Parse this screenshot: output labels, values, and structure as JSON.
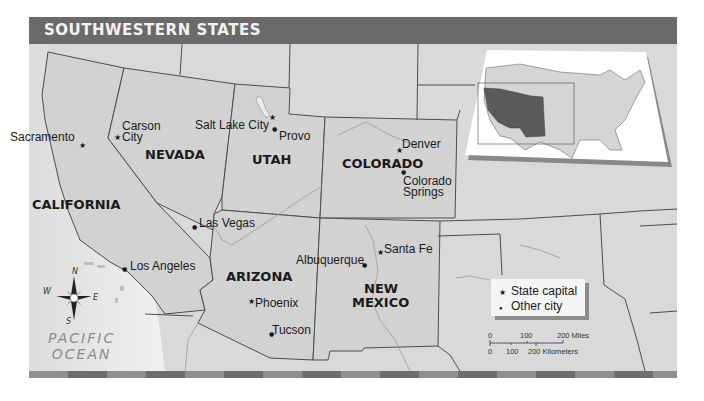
{
  "title": "SOUTHWESTERN STATES",
  "states": [
    {
      "name": "CALIFORNIA",
      "x": 32,
      "y": 198
    },
    {
      "name": "NEVADA",
      "x": 145,
      "y": 148
    },
    {
      "name": "UTAH",
      "x": 252,
      "y": 153
    },
    {
      "name": "COLORADO",
      "x": 342,
      "y": 157
    },
    {
      "name": "ARIZONA",
      "x": 226,
      "y": 270
    },
    {
      "name": "NEW",
      "x": 364,
      "y": 282
    },
    {
      "name": "MEXICO",
      "x": 352,
      "y": 296
    }
  ],
  "cities": [
    {
      "name": "Sacramento",
      "type": "capital",
      "x": 82,
      "y": 146,
      "label_x": 10,
      "label_y": 131
    },
    {
      "name": "Carson",
      "type": "capital",
      "x": 117,
      "y": 138,
      "label_x": 122,
      "label_y": 120
    },
    {
      "name": "City",
      "type": "none",
      "x": 0,
      "y": 0,
      "label_x": 122,
      "label_y": 131
    },
    {
      "name": "Salt Lake City",
      "type": "capital",
      "x": 272,
      "y": 118,
      "label_x": 195,
      "label_y": 119
    },
    {
      "name": "Provo",
      "type": "city",
      "x": 275,
      "y": 130,
      "label_x": 279,
      "label_y": 130
    },
    {
      "name": "Denver",
      "type": "capital",
      "x": 399,
      "y": 151,
      "label_x": 402,
      "label_y": 138
    },
    {
      "name": "Colorado",
      "type": "city",
      "x": 404,
      "y": 173,
      "label_x": 403,
      "label_y": 175
    },
    {
      "name": "Springs",
      "type": "none",
      "x": 0,
      "y": 0,
      "label_x": 403,
      "label_y": 186
    },
    {
      "name": "Las Vegas",
      "type": "city",
      "x": 195,
      "y": 228,
      "label_x": 199,
      "label_y": 217
    },
    {
      "name": "Los Angeles",
      "type": "city",
      "x": 125,
      "y": 270,
      "label_x": 130,
      "label_y": 260
    },
    {
      "name": "Albuquerque",
      "type": "city",
      "x": 365,
      "y": 266,
      "label_x": 296,
      "label_y": 254
    },
    {
      "name": "Santa Fe",
      "type": "capital",
      "x": 380,
      "y": 253,
      "label_x": 384,
      "label_y": 243
    },
    {
      "name": "Phoenix",
      "type": "capital",
      "x": 251,
      "y": 302,
      "label_x": 255,
      "label_y": 297
    },
    {
      "name": "Tucson",
      "type": "city",
      "x": 272,
      "y": 335,
      "label_x": 272,
      "label_y": 324
    }
  ],
  "ocean": {
    "line1": "PACIFIC",
    "line2": "OCEAN"
  },
  "compass": {
    "n": "N",
    "s": "S",
    "e": "E",
    "w": "W"
  },
  "legend": {
    "capital_symbol": "★",
    "capital_label": "State capital",
    "city_symbol": "●",
    "city_label": "Other city"
  },
  "scale_bar": {
    "miles": [
      "0",
      "100",
      "200 Miles"
    ],
    "kilometers": [
      "0",
      "100",
      "200 Kilometers"
    ]
  },
  "colors": {
    "land": "#d6d6d6",
    "highlight_state": "#d0d0d0",
    "water": "#e9e9e9",
    "border": "#4d4d4d",
    "title_bar": "#6a6a6a",
    "inset_highlight": "#5a5a5a"
  }
}
